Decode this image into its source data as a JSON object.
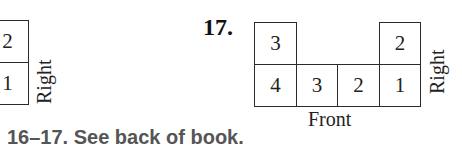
{
  "left_figure": {
    "cells": [
      {
        "value": "2",
        "row": "top"
      },
      {
        "value": "1",
        "row": "bottom"
      }
    ],
    "side_label": "Right"
  },
  "exercise_17": {
    "number": "17.",
    "top_row": [
      {
        "column": 1,
        "value": "3"
      },
      {
        "column": 4,
        "value": "2"
      }
    ],
    "bottom_row": [
      "4",
      "3",
      "2",
      "1"
    ],
    "side_label": "Right",
    "front_label": "Front"
  },
  "answer_note": "16–17. See back of book."
}
